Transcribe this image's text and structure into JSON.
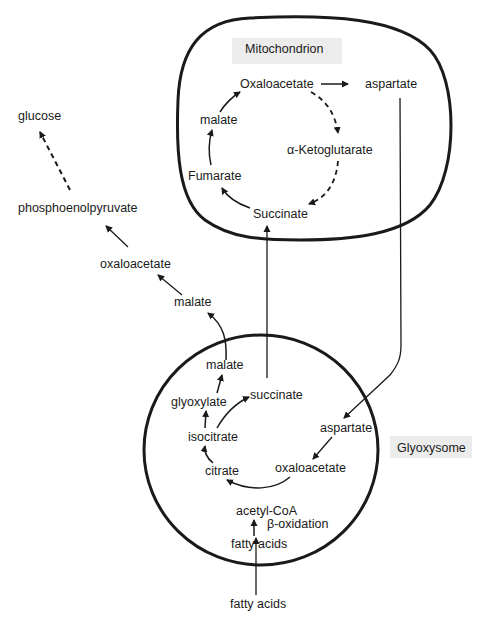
{
  "compartments": {
    "mitochondrion": {
      "label": "Mitochondrion"
    },
    "glyoxysome": {
      "label": "Glyoxysome"
    }
  },
  "mitochondrion_cycle": {
    "oxaloacetate": "Oxaloacetate",
    "aspartate": "aspartate",
    "alpha_ketoglutarate": "α-Ketoglutarate",
    "succinate": "Succinate",
    "fumarate": "Fumarate",
    "malate": "malate"
  },
  "cytosol": {
    "glucose": "glucose",
    "phosphoenolpyruvate": "phosphoenolpyruvate",
    "oxaloacetate": "oxaloacetate",
    "malate": "malate",
    "fatty_acids": "fatty acids"
  },
  "glyoxysome_cycle": {
    "malate": "malate",
    "glyoxylate": "glyoxylate",
    "succinate": "succinate",
    "isocitrate": "isocitrate",
    "citrate": "citrate",
    "aspartate": "aspartate",
    "oxaloacetate": "oxaloacetate",
    "acetyl_coa": "acetyl-CoA",
    "beta_oxidation": "β-oxidation",
    "fatty_acids": "fatty acids"
  },
  "colors": {
    "line": "#1a1a1a",
    "background": "#ffffff",
    "label_bg": "#ececec"
  }
}
